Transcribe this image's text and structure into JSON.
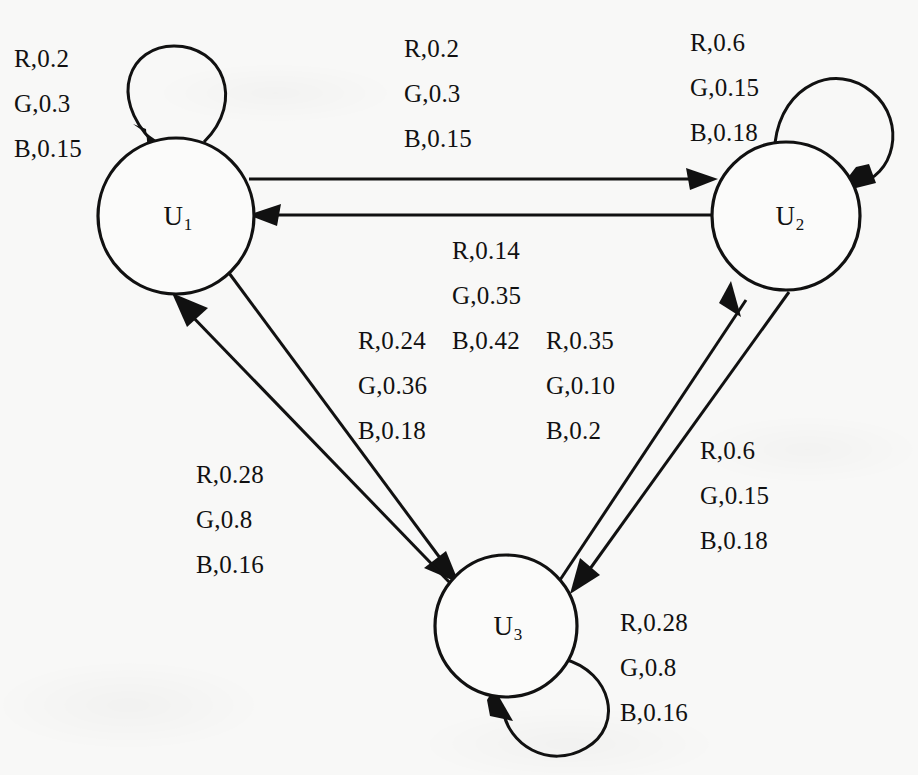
{
  "diagram": {
    "type": "state-transition-graph",
    "title": "",
    "background_color": "#f8f8f7",
    "ink_color": "#111111",
    "nodes": [
      {
        "id": "U1",
        "label": "U",
        "subscript": "1",
        "cx": 176,
        "cy": 216,
        "r": 78
      },
      {
        "id": "U2",
        "label": "U",
        "subscript": "2",
        "cx": 786,
        "cy": 216,
        "r": 74
      },
      {
        "id": "U3",
        "label": "U",
        "subscript": "3",
        "cx": 506,
        "cy": 626,
        "r": 71
      }
    ],
    "edges": [
      {
        "id": "e-u1-self",
        "from": "U1",
        "to": "U1",
        "kind": "self-loop",
        "label_lines": [
          "R,0.2",
          "G,0.3",
          "B,0.15"
        ],
        "label_x": 14,
        "label_y": 36
      },
      {
        "id": "e-u1-u2",
        "from": "U1",
        "to": "U2",
        "kind": "straight",
        "label_lines": [
          "R,0.2",
          "G,0.3",
          "B,0.15"
        ],
        "label_x": 404,
        "label_y": 26
      },
      {
        "id": "e-u2-self",
        "from": "U2",
        "to": "U2",
        "kind": "self-loop",
        "label_lines": [
          "R,0.6",
          "G,0.15",
          "B,0.18"
        ],
        "label_x": 690,
        "label_y": 20
      },
      {
        "id": "e-u2-u1",
        "from": "U2",
        "to": "U1",
        "kind": "straight",
        "label_lines": [
          "R,0.14",
          "G,0.35",
          "B,0.42"
        ],
        "label_x": 452,
        "label_y": 228
      },
      {
        "id": "e-u1-u3",
        "from": "U1",
        "to": "U3",
        "kind": "straight",
        "label_lines": [
          "R,0.24",
          "G,0.36",
          "B,0.18"
        ],
        "label_x": 358,
        "label_y": 318
      },
      {
        "id": "e-u3-u2",
        "from": "U3",
        "to": "U2",
        "kind": "straight",
        "label_lines": [
          "R,0.35",
          "G,0.10",
          "B,0.2"
        ],
        "label_x": 546,
        "label_y": 318
      },
      {
        "id": "e-u2-u3",
        "from": "U2",
        "to": "U3",
        "kind": "straight",
        "label_lines": [
          "R,0.6",
          "G,0.15",
          "B,0.18"
        ],
        "label_x": 700,
        "label_y": 428
      },
      {
        "id": "e-u3-u1",
        "from": "U3",
        "to": "U1",
        "kind": "straight",
        "label_lines": [
          "R,0.28",
          "G,0.8",
          "B,0.16"
        ],
        "label_x": 196,
        "label_y": 452
      },
      {
        "id": "e-u3-self",
        "from": "U3",
        "to": "U3",
        "kind": "self-loop",
        "label_lines": [
          "R,0.28",
          "G,0.8",
          "B,0.16"
        ],
        "label_x": 620,
        "label_y": 600
      }
    ]
  }
}
